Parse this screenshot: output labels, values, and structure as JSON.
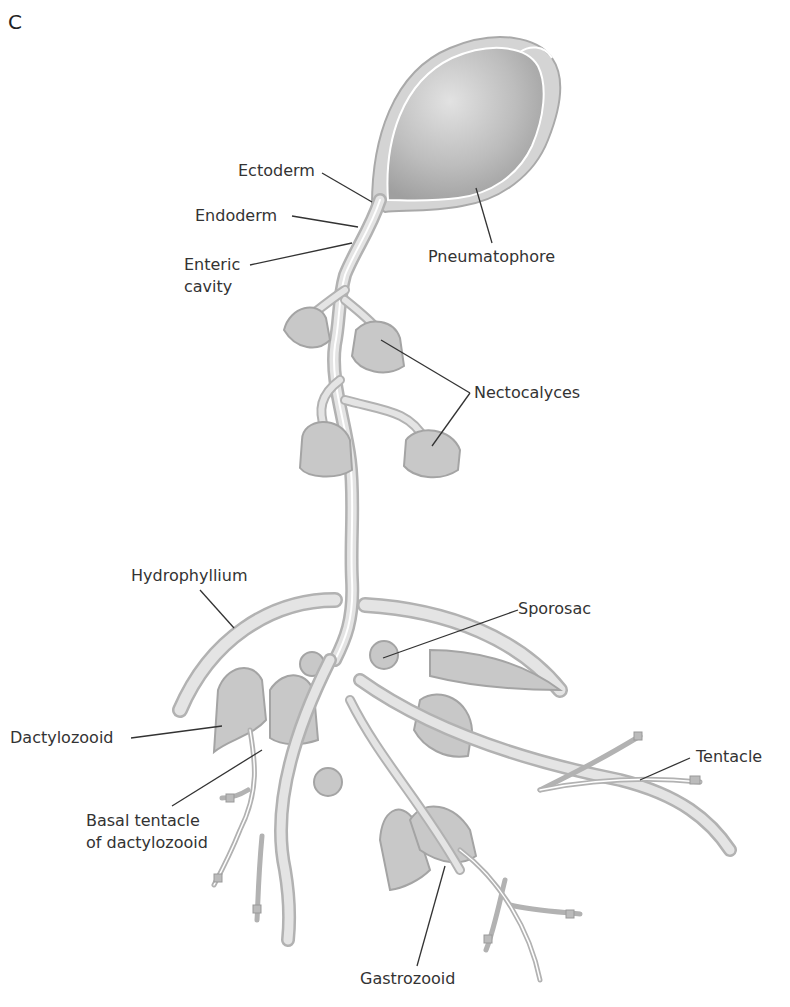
{
  "figure": {
    "panel_letter": "C"
  },
  "labels": {
    "ectoderm": "Ectoderm",
    "endoderm": "Endoderm",
    "enteric_cavity_line1": "Enteric",
    "enteric_cavity_line2": "cavity",
    "pneumatophore": "Pneumatophore",
    "nectocalyces": "Nectocalyces",
    "hydrophyllium": "Hydrophyllium",
    "sporosac": "Sporosac",
    "dactylozooid": "Dactylozooid",
    "tentacle": "Tentacle",
    "basal_tentacle_line1": "Basal tentacle",
    "basal_tentacle_line2": "of dactylozooid",
    "gastrozooid": "Gastrozooid"
  },
  "colors": {
    "tissue_fill": "#d4d4d4",
    "tissue_outline": "#a9a9a9",
    "leader_line": "#333333",
    "label_text": "#333333",
    "background": "#ffffff"
  }
}
